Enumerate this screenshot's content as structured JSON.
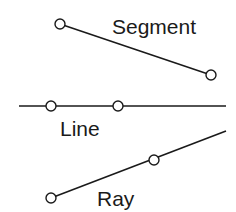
{
  "diagram": {
    "background": "#ffffff",
    "ink_color": "#1a1a1a",
    "segment": {
      "label": "Segment",
      "endpoints": [
        [
          60,
          24
        ],
        [
          211,
          75
        ]
      ],
      "label_pos": [
        112,
        30
      ]
    },
    "line": {
      "label": "Line",
      "extent": [
        [
          19,
          106
        ],
        [
          226,
          106
        ]
      ],
      "points": [
        [
          51,
          106
        ],
        [
          118,
          106
        ]
      ],
      "label_pos": [
        60,
        136
      ]
    },
    "ray": {
      "label": "Ray",
      "origin": [
        51,
        198
      ],
      "through": [
        154,
        160
      ],
      "end": [
        226,
        131
      ],
      "label_pos": [
        97,
        200
      ]
    }
  }
}
